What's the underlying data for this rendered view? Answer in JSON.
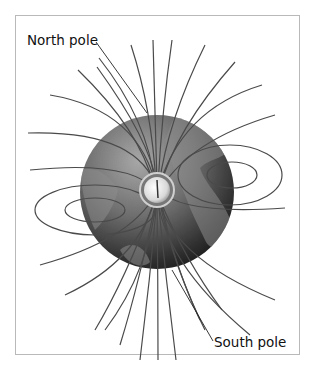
{
  "figure": {
    "labels": {
      "north_pole": "North pole",
      "south_pole": "South pole"
    },
    "elements": [
      "globe",
      "compass",
      "magnetic-field-lines"
    ],
    "colors": {
      "frame": "#b9b9b9",
      "field_line": "#555555",
      "globe_light": "#9a9a9a",
      "globe_dark": "#1a1a1a"
    }
  }
}
